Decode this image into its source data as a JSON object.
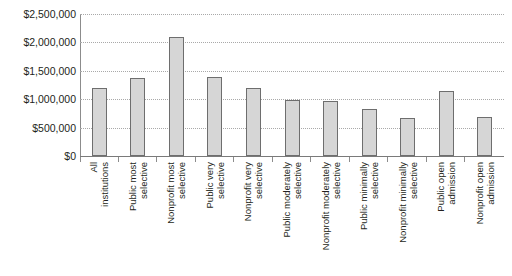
{
  "chart_data": {
    "type": "bar",
    "title": "",
    "subtitle": "",
    "xlabel": "",
    "ylabel": "",
    "ylim": [
      0,
      2500000
    ],
    "y_tick_step": 500000,
    "grid": true,
    "legend": false,
    "orientation": "vertical",
    "y_ticks": [
      "$2,500,000",
      "$2,000,000",
      "$1,500,000",
      "$1,000,000",
      "$500,000",
      "$0"
    ],
    "y_tick_values": [
      2500000,
      2000000,
      1500000,
      1000000,
      500000,
      0
    ],
    "categories": [
      "All institutions",
      "Public most selective",
      "Nonprofit most selective",
      "Public very selective",
      "Nonprofit very selective",
      "Public moderately selective",
      "Nonprofit moderately selective",
      "Public minimally selective",
      "Nonprofit minimally selective",
      "Public open admission",
      "Nonprofit open admission"
    ],
    "category_lines": [
      [
        "All",
        "institutions"
      ],
      [
        "Public most",
        "selective"
      ],
      [
        "Nonprofit most",
        "selective"
      ],
      [
        "Public very",
        "selective"
      ],
      [
        "Nonprofit very",
        "selective"
      ],
      [
        "Public moderately",
        "selective"
      ],
      [
        "Nonprofit moderately",
        "selective"
      ],
      [
        "Public minimally",
        "selective"
      ],
      [
        "Nonprofit minimally",
        "selective"
      ],
      [
        "Public open",
        "admission"
      ],
      [
        "Nonprofit open",
        "admission"
      ]
    ],
    "values": [
      1200000,
      1370000,
      2100000,
      1390000,
      1200000,
      990000,
      960000,
      820000,
      670000,
      1150000,
      680000
    ],
    "bar_fill_color": "#d6d6d6",
    "bar_border_color": "#6e6e6e",
    "gridline_color": "#a9a9a9",
    "axis_color": "#8c8c8c",
    "text_color": "#231f20",
    "background_color": "#ffffff"
  }
}
